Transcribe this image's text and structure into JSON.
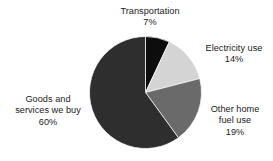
{
  "chart_data": {
    "type": "pie",
    "title": "",
    "subtitle": "",
    "xlabel": "",
    "ylabel": "",
    "legend_position": "none",
    "grid": false,
    "labels_outside": true,
    "start_angle_deg": 0,
    "direction": "clockwise",
    "categories": [
      "Transportation",
      "Electricity use",
      "Other home fuel use",
      "Goods and services we buy"
    ],
    "values": [
      7,
      14,
      19,
      60
    ],
    "value_labels": [
      "7%",
      "14%",
      "19%",
      "60%"
    ],
    "units": "percent",
    "total": 100,
    "colors": [
      "#0d0d0d",
      "#d4d4d4",
      "#6a6a6a",
      "#2e2e2e"
    ],
    "slices": [
      {
        "name": "Transportation",
        "value": 7,
        "value_label": "7%",
        "color": "#0d0d0d",
        "start_deg": 0,
        "end_deg": 25.2
      },
      {
        "name": "Electricity use",
        "value": 14,
        "value_label": "14%",
        "color": "#d4d4d4",
        "start_deg": 25.2,
        "end_deg": 75.6
      },
      {
        "name": "Other home fuel use",
        "value": 19,
        "value_label": "19%",
        "color": "#6a6a6a",
        "start_deg": 75.6,
        "end_deg": 144.0
      },
      {
        "name": "Goods and services we buy",
        "value": 60,
        "value_label": "60%",
        "color": "#2e2e2e",
        "start_deg": 144.0,
        "end_deg": 360.0
      }
    ]
  },
  "labels": {
    "transportation": {
      "line1": "Transportation",
      "value": "7%"
    },
    "electricity": {
      "line1": "Electricity use",
      "value": "14%"
    },
    "other_home_fuel": {
      "line1": "Other home",
      "line2": "fuel use",
      "value": "19%"
    },
    "goods_services": {
      "line1": "Goods and",
      "line2": "services we buy",
      "value": "60%"
    }
  },
  "style": {
    "background": "#ffffff",
    "text_color": "#1a1a1a"
  }
}
